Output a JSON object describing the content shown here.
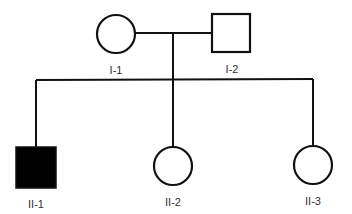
{
  "colors": {
    "line": "#111111",
    "affected": "#000000",
    "unaffected": "#ffffff",
    "label": "#333333"
  },
  "generations": [
    {
      "id": "I",
      "members": [
        {
          "id": "I-1",
          "label": "I-1",
          "sex": "female",
          "shape": "circle",
          "affected": false
        },
        {
          "id": "I-2",
          "label": "I-2",
          "sex": "male",
          "shape": "square",
          "affected": false
        }
      ]
    },
    {
      "id": "II",
      "members": [
        {
          "id": "II-1",
          "label": "II-1",
          "sex": "male",
          "shape": "square",
          "affected": true
        },
        {
          "id": "II-2",
          "label": "II-2",
          "sex": "female",
          "shape": "circle",
          "affected": false
        },
        {
          "id": "II-3",
          "label": "II-3",
          "sex": "female",
          "shape": "circle",
          "affected": false
        }
      ]
    }
  ],
  "labels": {
    "i1": "I-1",
    "i2": "I-2",
    "ii1": "II-1",
    "ii2": "II-2",
    "ii3": "II-3"
  },
  "relationships": [
    {
      "type": "mating",
      "partners": [
        "I-1",
        "I-2"
      ],
      "children": [
        "II-1",
        "II-2",
        "II-3"
      ]
    }
  ]
}
